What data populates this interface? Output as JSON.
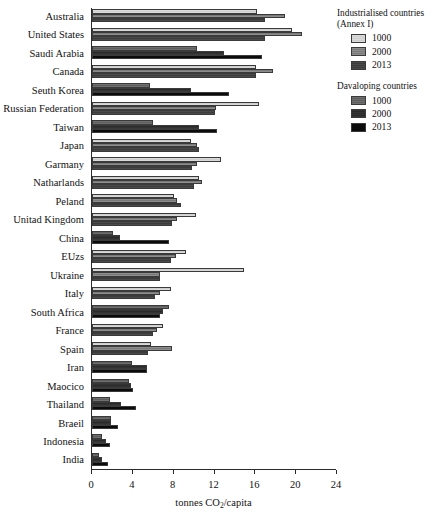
{
  "chart_data": {
    "type": "bar",
    "orientation": "horizontal",
    "title": "",
    "xlabel": "tonnes CO2/capita",
    "xlabel_display": "tonnes CO",
    "xlabel_sub": "2",
    "xlabel_tail": "/capita",
    "ylabel": "",
    "xlim": [
      0,
      24
    ],
    "xticks": [
      0,
      4,
      8,
      12,
      16,
      20,
      24
    ],
    "grid": false,
    "legend_position": "right",
    "categories": [
      "Australia",
      "United States",
      "Saudi Arabia",
      "Canada",
      "Seuth Korea",
      "Russian Federation",
      "Taiwan",
      "Japan",
      "Garmany",
      "Natharlands",
      "Peland",
      "Unitad Kingdom",
      "China",
      "EUzs",
      "Ukraine",
      "Italy",
      "South Africa",
      "France",
      "Spain",
      "Iran",
      "Maocico",
      "Thailand",
      "Braeil",
      "Indonesia",
      "India"
    ],
    "category_groups": [
      "industrialised",
      "industrialised",
      "developing",
      "industrialised",
      "developing",
      "industrialised",
      "developing",
      "industrialised",
      "industrialised",
      "industrialised",
      "industrialised",
      "industrialised",
      "developing",
      "industrialised",
      "industrialised",
      "industrialised",
      "developing",
      "industrialised",
      "industrialised",
      "developing",
      "developing",
      "developing",
      "developing",
      "developing",
      "developing"
    ],
    "series": [
      {
        "name": "1000",
        "values": [
          16.2,
          19.6,
          10.3,
          16.1,
          5.7,
          16.4,
          6.0,
          9.7,
          12.6,
          10.5,
          8.0,
          10.2,
          2.1,
          9.2,
          14.9,
          7.7,
          7.5,
          7.0,
          5.8,
          3.9,
          3.6,
          1.8,
          1.9,
          1.0,
          0.7
        ]
      },
      {
        "name": "2000",
        "values": [
          18.9,
          20.6,
          12.9,
          17.7,
          9.7,
          12.1,
          10.5,
          10.3,
          10.3,
          10.8,
          8.3,
          8.3,
          2.7,
          8.2,
          6.7,
          6.7,
          7.0,
          6.4,
          7.8,
          5.4,
          3.8,
          2.8,
          1.9,
          1.4,
          1.0
        ]
      },
      {
        "name": "2013",
        "values": [
          16.9,
          16.9,
          16.7,
          16.1,
          13.4,
          12.0,
          12.2,
          10.5,
          9.8,
          10.0,
          8.7,
          7.8,
          7.5,
          7.7,
          6.7,
          6.2,
          6.7,
          6.0,
          5.5,
          5.4,
          4.0,
          4.3,
          2.5,
          1.8,
          1.6
        ]
      }
    ]
  },
  "legend": {
    "groups": [
      {
        "title_line1": "Industrialised countries",
        "title_line2": "(Annex I)",
        "entries": [
          {
            "label": "1000",
            "swatch": "light-grey-hatch",
            "color": "#d4d4d4"
          },
          {
            "label": "2000",
            "swatch": "mid-grey-hatch",
            "color": "#818181"
          },
          {
            "label": "2013",
            "swatch": "dark-grey-hatch",
            "color": "#434343"
          }
        ]
      },
      {
        "title_line1": "Davaloping countries",
        "title_line2": "",
        "entries": [
          {
            "label": "1000",
            "swatch": "grey-hatch",
            "color": "#666666"
          },
          {
            "label": "2000",
            "swatch": "very-dark-hatch",
            "color": "#2e2e2e"
          },
          {
            "label": "2013",
            "swatch": "black-solid",
            "color": "#0b0b0b"
          }
        ]
      }
    ]
  },
  "axis": {
    "tick_labels": [
      "0",
      "4",
      "8",
      "12",
      "16",
      "20",
      "24"
    ],
    "title_prefix": "tonnes CO",
    "title_sub": "2",
    "title_suffix": "/capita"
  }
}
